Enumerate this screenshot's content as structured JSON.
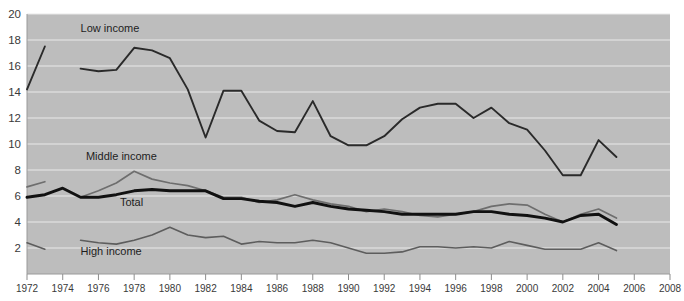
{
  "chart_data": {
    "type": "line",
    "title": "",
    "xlabel": "",
    "ylabel": "",
    "xlim": [
      1972,
      2008
    ],
    "ylim": [
      0,
      20
    ],
    "grid": true,
    "legend": "inline-labels",
    "xticks": [
      1972,
      1974,
      1976,
      1978,
      1980,
      1982,
      1984,
      1986,
      1988,
      1990,
      1992,
      1994,
      1996,
      1998,
      2000,
      2002,
      2004,
      2006,
      2008
    ],
    "yticks": [
      2,
      4,
      6,
      8,
      10,
      12,
      14,
      16,
      18,
      20
    ],
    "colors": {
      "low": "#2a2a2a",
      "middle": "#6e6e6e",
      "total": "#111111",
      "high": "#5d5d5d",
      "plot_background": "#bdbdbd",
      "gridline": "#e9e9e9",
      "page_background": "#ffffff"
    },
    "series": [
      {
        "name": "Low income",
        "label": "Low income",
        "label_x": 1975.0,
        "label_y": 18.6,
        "segments": [
          {
            "x": [
              1972,
              1973
            ],
            "values": [
              14.2,
              17.5
            ]
          },
          {
            "x": [
              1975,
              1976,
              1977,
              1978,
              1979,
              1980,
              1981,
              1982,
              1983,
              1984,
              1985,
              1986,
              1987,
              1988,
              1989,
              1990,
              1991,
              1992,
              1993,
              1994,
              1995,
              1996,
              1997,
              1998,
              1999,
              2000,
              2001,
              2002,
              2003,
              2004,
              2005
            ],
            "values": [
              15.8,
              15.6,
              15.7,
              17.4,
              17.2,
              16.6,
              14.2,
              10.5,
              14.1,
              14.1,
              11.8,
              11.0,
              10.9,
              13.3,
              10.6,
              9.9,
              9.9,
              10.6,
              11.9,
              12.8,
              13.1,
              13.1,
              12.0,
              12.8,
              11.6,
              11.1,
              9.5,
              7.6,
              7.6,
              10.3,
              9.0
            ]
          }
        ]
      },
      {
        "name": "Middle income",
        "label": "Middle income",
        "label_x": 1975.3,
        "label_y": 8.8,
        "segments": [
          {
            "x": [
              1972,
              1973
            ],
            "values": [
              6.7,
              7.1
            ]
          },
          {
            "x": [
              1975,
              1976,
              1977,
              1978,
              1979,
              1980,
              1981,
              1982,
              1983,
              1984,
              1985,
              1986,
              1987,
              1988,
              1989,
              1990,
              1991,
              1992,
              1993,
              1994,
              1995,
              1996,
              1997,
              1998,
              1999,
              2000,
              2001,
              2002,
              2003,
              2004,
              2005
            ],
            "values": [
              5.9,
              6.4,
              7.0,
              7.9,
              7.3,
              7.0,
              6.8,
              6.4,
              5.9,
              5.9,
              5.5,
              5.7,
              6.1,
              5.7,
              5.4,
              5.2,
              4.8,
              5.0,
              4.8,
              4.5,
              4.4,
              4.6,
              4.8,
              5.2,
              5.4,
              5.3,
              4.6,
              4.0,
              4.6,
              5.0,
              4.3
            ]
          }
        ]
      },
      {
        "name": "Total",
        "label": "Total",
        "label_x": 1977.2,
        "label_y": 5.2,
        "segments": [
          {
            "x": [
              1972,
              1973,
              1974,
              1975,
              1976,
              1977,
              1978,
              1979,
              1980,
              1981,
              1982,
              1983,
              1984,
              1985,
              1986,
              1987,
              1988,
              1989,
              1990,
              1991,
              1992,
              1993,
              1994,
              1995,
              1996,
              1997,
              1998,
              1999,
              2000,
              2001,
              2002,
              2003,
              2004,
              2005
            ],
            "values": [
              5.9,
              6.1,
              6.6,
              5.9,
              5.9,
              6.1,
              6.4,
              6.5,
              6.4,
              6.4,
              6.4,
              5.8,
              5.8,
              5.6,
              5.5,
              5.2,
              5.5,
              5.2,
              5.0,
              4.9,
              4.8,
              4.6,
              4.6,
              4.6,
              4.6,
              4.8,
              4.8,
              4.6,
              4.5,
              4.3,
              4.0,
              4.5,
              4.6,
              3.8
            ]
          }
        ]
      },
      {
        "name": "High income",
        "label": "High income",
        "label_x": 1975.0,
        "label_y": 1.5,
        "segments": [
          {
            "x": [
              1972,
              1973
            ],
            "values": [
              2.4,
              1.9
            ]
          },
          {
            "x": [
              1975,
              1976,
              1977,
              1978,
              1979,
              1980,
              1981,
              1982,
              1983,
              1984,
              1985,
              1986,
              1987,
              1988,
              1989,
              1990,
              1991,
              1992,
              1993,
              1994,
              1995,
              1996,
              1997,
              1998,
              1999,
              2000,
              2001,
              2002,
              2003,
              2004,
              2005
            ],
            "values": [
              2.6,
              2.4,
              2.3,
              2.6,
              3.0,
              3.6,
              3.0,
              2.8,
              2.9,
              2.3,
              2.5,
              2.4,
              2.4,
              2.6,
              2.4,
              2.0,
              1.6,
              1.6,
              1.7,
              2.1,
              2.1,
              2.0,
              2.1,
              2.0,
              2.5,
              2.2,
              1.9,
              1.9,
              1.9,
              2.4,
              1.8
            ]
          }
        ]
      }
    ]
  }
}
